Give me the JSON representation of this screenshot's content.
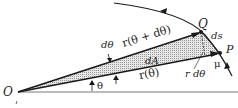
{
  "diagram": {
    "type": "polar-area-element",
    "colors": {
      "ink": "#1a1a1a",
      "shade": "#c8c8c8",
      "background": "#ffffff"
    },
    "points": {
      "origin": {
        "label": "O",
        "x": 18,
        "y": 92
      },
      "Q": {
        "label": "Q",
        "x": 201,
        "y": 32
      },
      "P": {
        "label": "P",
        "x": 220,
        "y": 53
      }
    },
    "labels": {
      "O": "O",
      "Q": "Q",
      "P": "P",
      "ds": "ds",
      "dtheta": "dθ",
      "r_theta_plus": "r(θ + dθ)",
      "r_theta": "r(θ)",
      "dA": "dA",
      "r_dtheta": "r dθ",
      "mu": "μ",
      "theta": "θ"
    }
  }
}
